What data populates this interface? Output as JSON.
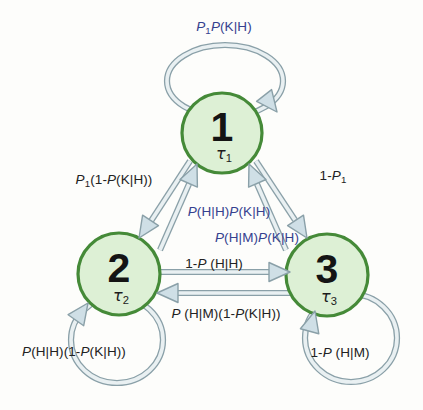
{
  "colors": {
    "state_fill": "#ddf0d5",
    "state_border": "#458a38",
    "arrow_fill": "#cfdfe6",
    "arrow_outline": "#8aa0a8",
    "arrow_inner": "#e9f0f2",
    "label_blue": "#35418f",
    "label_black": "#222222"
  },
  "states": [
    {
      "id": "1",
      "number": "1",
      "tau": "τ",
      "tau_sub": "1"
    },
    {
      "id": "2",
      "number": "2",
      "tau": "τ",
      "tau_sub": "2"
    },
    {
      "id": "3",
      "number": "3",
      "tau": "τ",
      "tau_sub": "3"
    }
  ],
  "transitions": [
    {
      "from": "1",
      "to": "1",
      "color": "blue",
      "label": "P₁P(K|H)",
      "segments": [
        {
          "t": "P",
          "i": true
        },
        {
          "t": "1",
          "sub": true
        },
        {
          "t": "P",
          "i": true
        },
        {
          "t": "(K|H)"
        }
      ]
    },
    {
      "from": "1",
      "to": "2",
      "color": "black",
      "label": "P₁(1-P(K|H))",
      "segments": [
        {
          "t": "P",
          "i": true
        },
        {
          "t": "1",
          "sub": true
        },
        {
          "t": "(1-"
        },
        {
          "t": "P",
          "i": true
        },
        {
          "t": "(K|H))"
        }
      ]
    },
    {
      "from": "2",
      "to": "1",
      "color": "blue",
      "label": "P(H|H)P(K|H)",
      "segments": [
        {
          "t": "P",
          "i": true
        },
        {
          "t": "(H|H)"
        },
        {
          "t": "P",
          "i": true
        },
        {
          "t": "(K|H)"
        }
      ]
    },
    {
      "from": "1",
      "to": "3",
      "color": "black",
      "label": "1-P₁",
      "segments": [
        {
          "t": "1-"
        },
        {
          "t": "P",
          "i": true
        },
        {
          "t": "1",
          "sub": true
        }
      ]
    },
    {
      "from": "3",
      "to": "1",
      "color": "blue",
      "label": "P(H|M)P(K|H)",
      "segments": [
        {
          "t": "P",
          "i": true
        },
        {
          "t": "(H|M)"
        },
        {
          "t": "P",
          "i": true
        },
        {
          "t": "(K|H)"
        }
      ]
    },
    {
      "from": "2",
      "to": "3",
      "color": "black",
      "label": "1-P (H|H)",
      "segments": [
        {
          "t": "1-"
        },
        {
          "t": "P",
          "i": true
        },
        {
          "t": " (H|H)"
        }
      ]
    },
    {
      "from": "3",
      "to": "2",
      "color": "black",
      "label": "P (H|M)(1-P(K|H))",
      "segments": [
        {
          "t": "P",
          "i": true
        },
        {
          "t": " (H|M)(1-"
        },
        {
          "t": "P",
          "i": true
        },
        {
          "t": "(K|H))"
        }
      ]
    },
    {
      "from": "2",
      "to": "2",
      "color": "black",
      "label": "P(H|H)(1-P(K|H))",
      "segments": [
        {
          "t": "P",
          "i": true
        },
        {
          "t": "(H|H)(1-"
        },
        {
          "t": "P",
          "i": true
        },
        {
          "t": "(K|H))"
        }
      ]
    },
    {
      "from": "3",
      "to": "3",
      "color": "black",
      "label": "1-P (H|M)",
      "segments": [
        {
          "t": "1-"
        },
        {
          "t": "P",
          "i": true
        },
        {
          "t": " (H|M)"
        }
      ]
    }
  ]
}
